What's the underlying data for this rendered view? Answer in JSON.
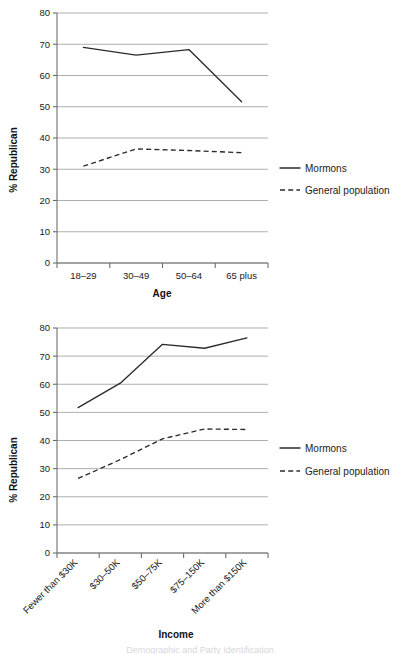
{
  "chart_data": [
    {
      "type": "line",
      "id": "age",
      "title": "",
      "xlabel": "Age",
      "ylabel": "% Republican",
      "categories": [
        "18–29",
        "30–49",
        "50–64",
        "65 plus"
      ],
      "ylim": [
        0,
        80
      ],
      "yticks": [
        0,
        10,
        20,
        30,
        40,
        50,
        60,
        70,
        80
      ],
      "grid": true,
      "legend_position": "right",
      "series": [
        {
          "name": "Mormons",
          "style": "solid",
          "values": [
            69,
            66.5,
            68.3,
            51.6
          ]
        },
        {
          "name": "General population",
          "style": "dashed",
          "values": [
            31,
            36.5,
            36,
            35.3
          ]
        }
      ]
    },
    {
      "type": "line",
      "id": "income",
      "title": "",
      "xlabel": "Income",
      "ylabel": "% Republican",
      "categories": [
        "Fewer than $30K",
        "$30–50K",
        "$50–75K",
        "$75–150K",
        "More than $150K"
      ],
      "ylim": [
        0,
        80
      ],
      "yticks": [
        0,
        10,
        20,
        30,
        40,
        50,
        60,
        70,
        80
      ],
      "grid": true,
      "legend_position": "right",
      "series": [
        {
          "name": "Mormons",
          "style": "solid",
          "values": [
            51.7,
            60.4,
            74.2,
            72.8,
            76.5
          ]
        },
        {
          "name": "General population",
          "style": "dashed",
          "values": [
            26.5,
            33.2,
            40.6,
            44.1,
            43.9
          ]
        }
      ]
    }
  ],
  "charts": {
    "age": {
      "ylabel": "% Republican",
      "xlabel": "Age",
      "yticks": [
        "0",
        "10",
        "20",
        "30",
        "40",
        "50",
        "60",
        "70",
        "80"
      ],
      "xticks": [
        "18–29",
        "30–49",
        "50–64",
        "65 plus"
      ],
      "legend": [
        "Mormons",
        "General population"
      ]
    },
    "income": {
      "ylabel": "% Republican",
      "xlabel": "Income",
      "yticks": [
        "0",
        "10",
        "20",
        "30",
        "40",
        "50",
        "60",
        "70",
        "80"
      ],
      "xticks": [
        "Fewer than $30K",
        "$30–50K",
        "$50–75K",
        "$75–150K",
        "More than $150K"
      ],
      "legend": [
        "Mormons",
        "General population"
      ]
    }
  },
  "caption": {
    "text": "Demographic and Party Identification"
  },
  "colors": {
    "line": "#2b2b2b",
    "grid": "#9a9a9a",
    "axis": "#6e6e6e",
    "text": "#1a1a1a",
    "background": "#ffffff"
  }
}
